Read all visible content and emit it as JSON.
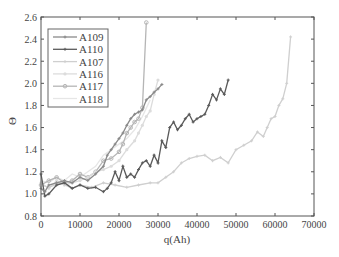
{
  "chart_data": {
    "type": "line",
    "title": "",
    "xlabel": "q(Ah)",
    "ylabel": "Θ",
    "xlim": [
      0,
      70000
    ],
    "ylim": [
      0.8,
      2.6
    ],
    "xticks": [
      0,
      10000,
      20000,
      30000,
      40000,
      50000,
      60000,
      70000
    ],
    "xtick_labels": [
      "0",
      "10000",
      "20000",
      "30000",
      "40000",
      "50000",
      "60000",
      "70000"
    ],
    "yticks": [
      0.8,
      1.0,
      1.2,
      1.4,
      1.6,
      1.8,
      2.0,
      2.2,
      2.4,
      2.6
    ],
    "ytick_labels": [
      "0.8",
      "1.0",
      "1.2",
      "1.4",
      "1.6",
      "1.8",
      "2.0",
      "2.2",
      "2.4",
      "2.6"
    ],
    "grid": false,
    "legend_position": "upper left",
    "series": [
      {
        "name": "A109",
        "color": "#8a8a8a",
        "marker": "+",
        "x": [
          0,
          1000,
          2000,
          4000,
          6000,
          8000,
          10000,
          12000,
          14000,
          16000,
          17000,
          18000,
          19000,
          20000,
          21000,
          22000,
          23000,
          24000,
          25000,
          26000,
          27000,
          28000,
          29000,
          30000,
          31000
        ],
        "y": [
          1.05,
          1.02,
          1.08,
          1.1,
          1.12,
          1.1,
          1.15,
          1.12,
          1.18,
          1.25,
          1.35,
          1.4,
          1.45,
          1.5,
          1.55,
          1.62,
          1.68,
          1.72,
          1.74,
          1.76,
          1.85,
          1.88,
          1.92,
          1.95,
          1.99
        ]
      },
      {
        "name": "A110",
        "color": "#5a5a5a",
        "marker": "+",
        "x": [
          0,
          1000,
          2000,
          4000,
          6000,
          8000,
          10000,
          12000,
          14000,
          16000,
          17000,
          18000,
          19000,
          20000,
          21000,
          22000,
          23000,
          24000,
          25000,
          26000,
          27000,
          28000,
          29000,
          30000,
          31000,
          32000,
          33000,
          34000,
          35000,
          36000,
          37000,
          38000,
          39000,
          40000,
          41000,
          42000,
          43000,
          44000,
          45000,
          46000,
          47000,
          48000
        ],
        "y": [
          1.18,
          0.98,
          1.0,
          1.08,
          1.1,
          1.05,
          1.08,
          1.05,
          1.06,
          1.02,
          1.05,
          1.1,
          1.2,
          1.12,
          1.25,
          1.15,
          1.18,
          1.15,
          1.22,
          1.28,
          1.3,
          1.25,
          1.35,
          1.28,
          1.48,
          1.42,
          1.6,
          1.65,
          1.58,
          1.62,
          1.68,
          1.72,
          1.65,
          1.68,
          1.7,
          1.72,
          1.8,
          1.9,
          1.85,
          1.95,
          1.9,
          2.03
        ]
      },
      {
        "name": "A107",
        "color": "#cfcfcf",
        "marker": "+",
        "x": [
          0,
          2000,
          5000,
          8000,
          10000,
          13000,
          16000,
          19000,
          22000,
          25000,
          28000,
          30000,
          32000,
          34000,
          36000,
          38000,
          40000,
          42000,
          44000,
          46000,
          48000,
          50000,
          52000,
          54000,
          55500,
          57000,
          58000,
          59000,
          60000,
          61000,
          62000,
          63000,
          64000
        ],
        "y": [
          1.08,
          1.06,
          1.1,
          1.05,
          1.08,
          1.06,
          1.1,
          1.08,
          1.06,
          1.08,
          1.1,
          1.1,
          1.15,
          1.2,
          1.28,
          1.32,
          1.34,
          1.35,
          1.3,
          1.33,
          1.28,
          1.4,
          1.44,
          1.48,
          1.56,
          1.52,
          1.6,
          1.68,
          1.7,
          1.8,
          1.86,
          2.0,
          2.42
        ]
      },
      {
        "name": "A116",
        "color": "#dcdcdc",
        "marker": "o",
        "x": [
          0,
          2000,
          4000,
          6000,
          8000,
          10000,
          12000,
          14000,
          16000,
          18000,
          20000,
          22000,
          24000,
          25000,
          26000,
          27000,
          28000,
          29000,
          30000
        ],
        "y": [
          1.1,
          1.05,
          1.12,
          1.08,
          1.1,
          1.12,
          1.15,
          1.2,
          1.22,
          1.25,
          1.3,
          1.4,
          1.48,
          1.55,
          1.62,
          1.7,
          1.75,
          1.9,
          2.03
        ]
      },
      {
        "name": "A117",
        "color": "#b5b5b5",
        "marker": "*",
        "x": [
          0,
          2000,
          4000,
          6000,
          8000,
          10000,
          12000,
          14000,
          16000,
          18000,
          20000,
          21000,
          22000,
          23000,
          24000,
          25000,
          26000,
          27000
        ],
        "y": [
          1.08,
          1.12,
          1.15,
          1.1,
          1.12,
          1.18,
          1.15,
          1.2,
          1.3,
          1.32,
          1.38,
          1.45,
          1.55,
          1.6,
          1.65,
          1.68,
          1.78,
          2.55
        ]
      },
      {
        "name": "A118",
        "color": "#e6e6e6",
        "marker": "none",
        "x": [
          0,
          2000,
          4000,
          6000,
          8000,
          10000,
          12000,
          14000,
          16000,
          18000,
          20000,
          22000,
          24000,
          26000,
          28000
        ],
        "y": [
          1.12,
          1.1,
          1.15,
          1.12,
          1.18,
          1.15,
          1.2,
          1.25,
          1.35,
          1.4,
          1.45,
          1.5,
          1.58,
          1.7,
          1.85
        ]
      }
    ]
  }
}
